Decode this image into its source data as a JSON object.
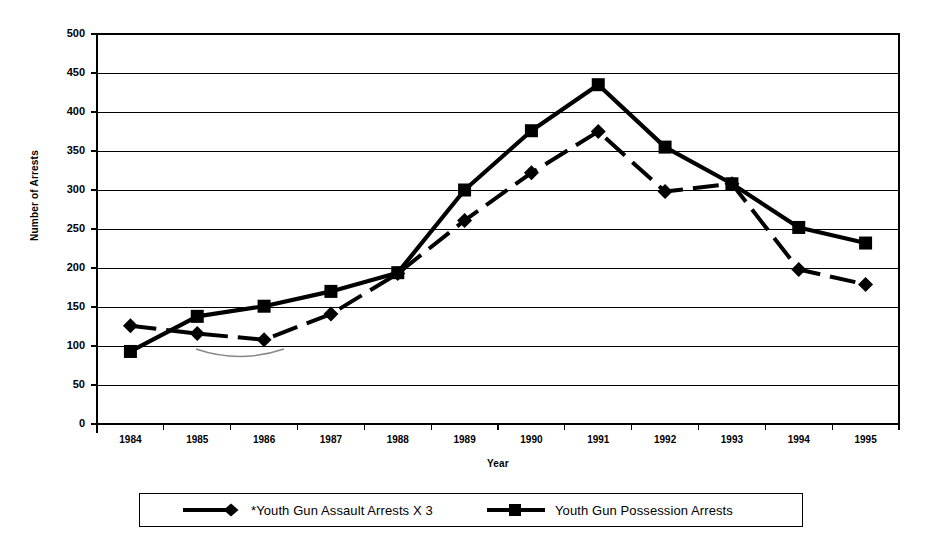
{
  "chart_data": {
    "type": "line",
    "title": "",
    "xlabel": "Year",
    "ylabel": "Number of Arrests",
    "categories": [
      "1984",
      "1985",
      "1986",
      "1987",
      "1988",
      "1989",
      "1990",
      "1991",
      "1992",
      "1993",
      "1994",
      "1995"
    ],
    "ylim": [
      0,
      500
    ],
    "ytick_step": 50,
    "yticks": [
      "500",
      "450",
      "400",
      "350",
      "300",
      "250",
      "200",
      "150",
      "100",
      "50",
      "0"
    ],
    "ytick_values": [
      500,
      450,
      400,
      350,
      300,
      250,
      200,
      150,
      100,
      50,
      0
    ],
    "grid": true,
    "grid_axis": "y",
    "legend_position": "bottom",
    "series": [
      {
        "name": "*Youth Gun Assault Arrests X 3",
        "marker": "diamond",
        "line_style": "dashed",
        "color": "#000000",
        "values": [
          126,
          116,
          108,
          141,
          193,
          261,
          322,
          375,
          298,
          308,
          198,
          179
        ]
      },
      {
        "name": "Youth Gun Possession Arrests",
        "marker": "square",
        "line_style": "solid",
        "color": "#000000",
        "values": [
          93,
          138,
          151,
          170,
          194,
          300,
          376,
          435,
          355,
          308,
          252,
          232
        ]
      }
    ]
  },
  "axes": {
    "y_title": "Number of Arrests",
    "x_title": "Year"
  },
  "legend": {
    "entries": [
      {
        "label": "*Youth Gun Assault Arrests X 3",
        "marker": "diamond-marker"
      },
      {
        "label": "Youth Gun Possession Arrests",
        "marker": "square-marker"
      }
    ]
  }
}
